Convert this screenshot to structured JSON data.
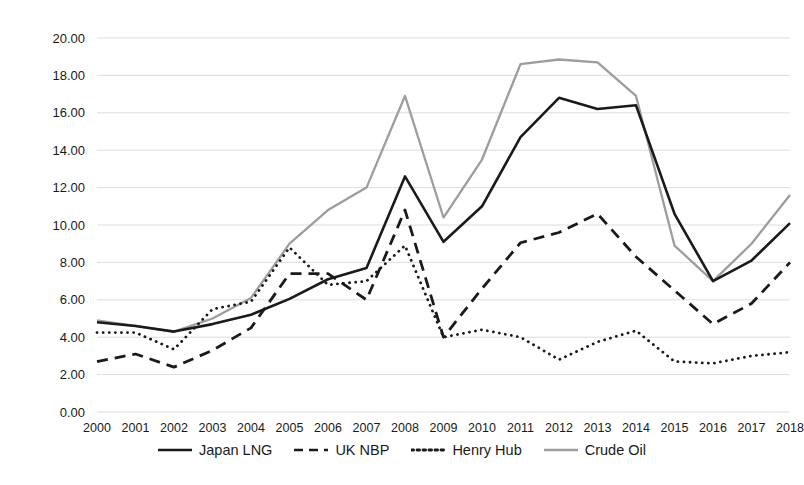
{
  "chart_data": {
    "type": "line",
    "title": "",
    "subtitle": "",
    "xlabel": "",
    "ylabel": "$MMbtu",
    "ylim": [
      0.0,
      20.0
    ],
    "ytick_step": 2.0,
    "ytick_labels": [
      "0.00",
      "2.00",
      "4.00",
      "6.00",
      "8.00",
      "10.00",
      "12.00",
      "14.00",
      "16.00",
      "18.00",
      "20.00"
    ],
    "grid": true,
    "legend_position": "bottom",
    "categories": [
      "2000",
      "2001",
      "2002",
      "2003",
      "2004",
      "2005",
      "2006",
      "2007",
      "2008",
      "2009",
      "2010",
      "2011",
      "2012",
      "2013",
      "2014",
      "2015",
      "2016",
      "2017",
      "2018"
    ],
    "series": [
      {
        "name": "Japan LNG",
        "color": "#1a1a1a",
        "style": "solid",
        "values": [
          4.8,
          4.6,
          4.3,
          4.7,
          5.2,
          6.05,
          7.1,
          7.7,
          12.6,
          9.1,
          11.0,
          14.7,
          16.8,
          16.2,
          16.4,
          10.6,
          7.0,
          8.1,
          10.1
        ]
      },
      {
        "name": "UK NBP",
        "color": "#1a1a1a",
        "style": "dashed",
        "values": [
          2.7,
          3.1,
          2.4,
          3.3,
          4.5,
          7.4,
          7.4,
          6.0,
          10.8,
          4.0,
          6.6,
          9.05,
          9.6,
          10.6,
          8.3,
          6.5,
          4.7,
          5.8,
          8.0
        ]
      },
      {
        "name": "Henry Hub",
        "color": "#1a1a1a",
        "style": "dotted",
        "values": [
          4.25,
          4.25,
          3.35,
          5.5,
          5.9,
          8.8,
          6.8,
          7.0,
          8.9,
          4.0,
          4.4,
          4.0,
          2.8,
          3.75,
          4.35,
          2.7,
          2.6,
          3.0,
          3.2
        ]
      },
      {
        "name": "Crude Oil",
        "color": "#9d9d9d",
        "style": "solid",
        "values": [
          4.9,
          4.6,
          4.3,
          5.0,
          6.1,
          9.0,
          10.8,
          12.0,
          16.9,
          10.4,
          13.5,
          18.6,
          18.85,
          18.7,
          16.9,
          8.9,
          7.0,
          9.0,
          11.6
        ]
      }
    ]
  },
  "axis": {
    "y_title": "$MMbtu"
  },
  "legend": {
    "items": [
      {
        "label": "Japan LNG",
        "icon": "solid-line-icon"
      },
      {
        "label": "UK NBP",
        "icon": "dashed-line-icon"
      },
      {
        "label": "Henry Hub",
        "icon": "dotted-line-icon"
      },
      {
        "label": "Crude Oil",
        "icon": "gray-solid-line-icon"
      }
    ]
  },
  "colors": {
    "dark": "#1a1a1a",
    "gray": "#9d9d9d",
    "grid": "#d9d9d9",
    "background": "#ffffff"
  }
}
